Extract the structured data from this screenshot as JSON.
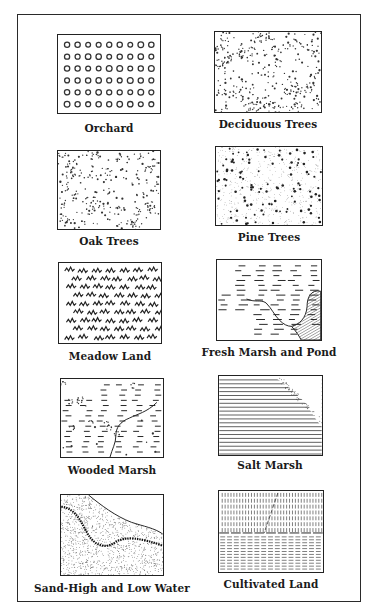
{
  "legend": {
    "items": [
      {
        "id": "orchard",
        "label": "Orchard",
        "pattern": "rows-of-small-rings"
      },
      {
        "id": "deciduous",
        "label": "Deciduous Trees",
        "pattern": "dense-scattered-clusters"
      },
      {
        "id": "oak",
        "label": "Oak Trees",
        "pattern": "scattered-clusters"
      },
      {
        "id": "pine",
        "label": "Pine Trees",
        "pattern": "stipple-with-star-dots"
      },
      {
        "id": "meadow",
        "label": "Meadow Land",
        "pattern": "grass-tufts"
      },
      {
        "id": "fresh_marsh",
        "label": "Fresh Marsh and Pond",
        "pattern": "dashes-with-hatched-pond"
      },
      {
        "id": "wooded_marsh",
        "label": "Wooded Marsh",
        "pattern": "dashes-with-clusters-and-stream"
      },
      {
        "id": "salt_marsh",
        "label": "Salt Marsh",
        "pattern": "horizontal-lines-with-dotted-shore"
      },
      {
        "id": "sand",
        "label": "Sand-High and Low Water",
        "pattern": "stipple-with-shorelines"
      },
      {
        "id": "cultivated",
        "label": "Cultivated Land",
        "pattern": "vertical-and-horizontal-dashes"
      }
    ]
  },
  "colors": {
    "ink": "#222222",
    "paper": "#ffffff"
  }
}
